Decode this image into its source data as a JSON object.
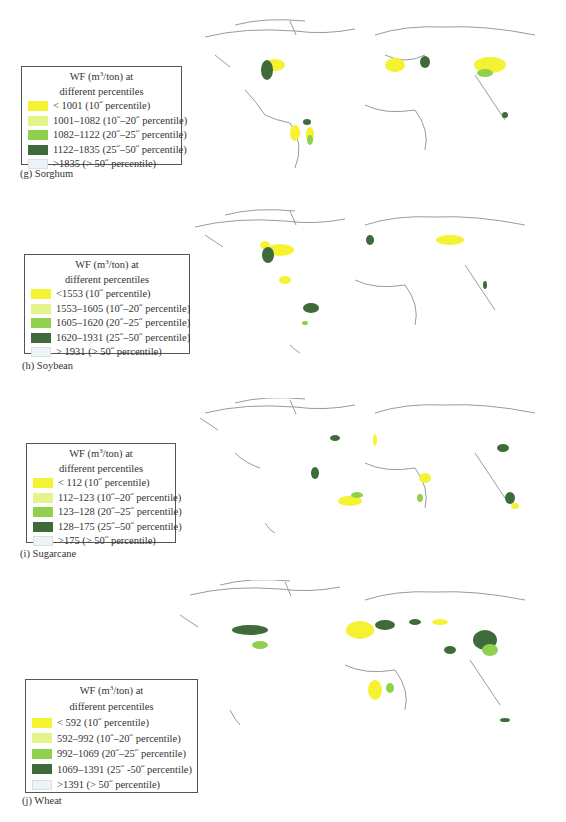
{
  "colors": {
    "p10": "#f5f232",
    "p10_20": "#e4f38a",
    "p20_25": "#8fd14f",
    "p25_50": "#3f6b3a",
    "p50": "#eef3f6",
    "coast": "#6b7278"
  },
  "legend_title_line1_pre": "WF (m",
  "legend_title_sup": "3",
  "legend_title_line1_post": "/ton) at",
  "legend_title_line2": "different percentiles",
  "panels": [
    {
      "caption": "(g) Sorghum",
      "items": [
        "< 1001 (10˝ percentile)",
        "1001–1082 (10˝–20˝ percentile)",
        "1082–1122 (20˝–25˝ percentile)",
        "1122–1835 (25˝–50˝ percentile)",
        ">1835 (> 50˝ percentile)"
      ]
    },
    {
      "caption": "(h) Soybean",
      "items": [
        "<1553 (10˝ percentile)",
        "1553–1605 (10˝–20˝ percentile)",
        "1605–1620 (20˝–25˝ percentile)",
        "1620–1931 (25˝–50˝ percentile)",
        "> 1931 (> 50˝ percentile)"
      ]
    },
    {
      "caption": "(i) Sugarcane",
      "items": [
        "< 112 (10˝ percentile)",
        "112–123 (10˝–20˝ percentile)",
        "123–128 (20˝–25˝ percentile)",
        "128–175 (25˝–50˝ percentile)",
        ">175 (> 50˝ percentile)"
      ]
    },
    {
      "caption": "(j) Wheat",
      "items": [
        "< 592 (10˝ percentile)",
        "592–992 (10˝–20˝ percentile)",
        "992–1069 (20˝–25˝ percentile)",
        "1069–1391 (25˝ -50˝ percentile)",
        ">1391 (> 50˝ percentile)"
      ]
    }
  ]
}
